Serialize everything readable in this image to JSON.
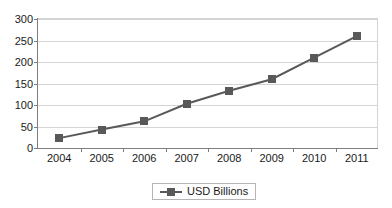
{
  "chart_data": {
    "type": "line",
    "title": "",
    "xlabel": "",
    "ylabel": "",
    "categories": [
      "2004",
      "2005",
      "2006",
      "2007",
      "2008",
      "2009",
      "2010",
      "2011"
    ],
    "series": [
      {
        "name": "USD Billions",
        "values": [
          23,
          43,
          62,
          103,
          133,
          160,
          210,
          260
        ],
        "color": "#595959",
        "marker": "square"
      }
    ],
    "ylim": [
      0,
      300
    ],
    "ytick_values": [
      0,
      50,
      100,
      150,
      200,
      250,
      300
    ],
    "ytick_labels": [
      "0",
      "50",
      "100",
      "150",
      "200",
      "250",
      "300"
    ],
    "grid": "horizontal",
    "legend_position": "bottom",
    "legend_entries": [
      "USD Billions"
    ],
    "annotations": []
  },
  "legend": {
    "label": "USD Billions"
  },
  "colors": {
    "series": "#595959",
    "gridline": "#d4d4d4",
    "axis": "#7d7d7d",
    "background": "#ffffff",
    "text": "#1a1a1a"
  }
}
